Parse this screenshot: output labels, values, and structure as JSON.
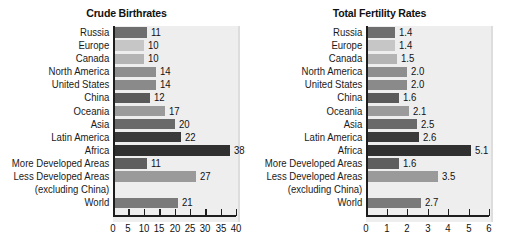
{
  "chart_data": [
    {
      "type": "bar",
      "orientation": "horizontal",
      "title": "Crude Birthrates",
      "xlabel": "",
      "ylabel": "",
      "xlim": [
        0,
        40
      ],
      "xticks": [
        0,
        5,
        10,
        15,
        20,
        25,
        30,
        35,
        40
      ],
      "grid": false,
      "legend": "none",
      "categories": [
        "Russia",
        "Europe",
        "Canada",
        "North America",
        "United States",
        "China",
        "Oceania",
        "Asia",
        "Latin America",
        "Africa",
        "More Developed Areas",
        "Less Developed Areas",
        "(excluding China)",
        "World"
      ],
      "values": [
        11,
        10,
        10,
        14,
        14,
        12,
        17,
        20,
        22,
        38,
        11,
        27,
        null,
        21
      ],
      "value_labels": [
        "11",
        "10",
        "10",
        "14",
        "14",
        "12",
        "17",
        "20",
        "22",
        "38",
        "11",
        "27",
        "",
        "21"
      ],
      "bar_colors": [
        "#6e6e6e",
        "#c6c6c6",
        "#b4b4b4",
        "#8e8e8e",
        "#8a8a8a",
        "#5a5a5a",
        "#9b9b9b",
        "#6a6a6a",
        "#3a3a3a",
        "#303030",
        "#5e5e5e",
        "#9a9a9a",
        "",
        "#7a7a7a"
      ]
    },
    {
      "type": "bar",
      "orientation": "horizontal",
      "title": "Total Fertility Rates",
      "xlabel": "",
      "ylabel": "",
      "xlim": [
        0,
        6
      ],
      "xticks": [
        0,
        1,
        2,
        3,
        4,
        5,
        6
      ],
      "grid": false,
      "legend": "none",
      "categories": [
        "Russia",
        "Europe",
        "Canada",
        "North America",
        "United States",
        "China",
        "Oceania",
        "Asia",
        "Latin America",
        "Africa",
        "More Developed Areas",
        "Less Developed Areas",
        "(excluding China)",
        "World"
      ],
      "values": [
        1.4,
        1.4,
        1.5,
        2.0,
        2.0,
        1.6,
        2.1,
        2.5,
        2.6,
        5.1,
        1.6,
        3.5,
        null,
        2.7
      ],
      "value_labels": [
        "1.4",
        "1.4",
        "1.5",
        "2.0",
        "2.0",
        "1.6",
        "2.1",
        "2.5",
        "2.6",
        "5.1",
        "1.6",
        "3.5",
        "",
        "2.7"
      ],
      "bar_colors": [
        "#6e6e6e",
        "#c6c6c6",
        "#b4b4b4",
        "#8e8e8e",
        "#8a8a8a",
        "#5a5a5a",
        "#9b9b9b",
        "#6a6a6a",
        "#3a3a3a",
        "#303030",
        "#5e5e5e",
        "#9a9a9a",
        "",
        "#7a7a7a"
      ]
    }
  ],
  "colors": {
    "plot_background": "#eeeeee",
    "axis": "#1d1d1d",
    "text": "#111111",
    "page_background": "#ffffff"
  }
}
